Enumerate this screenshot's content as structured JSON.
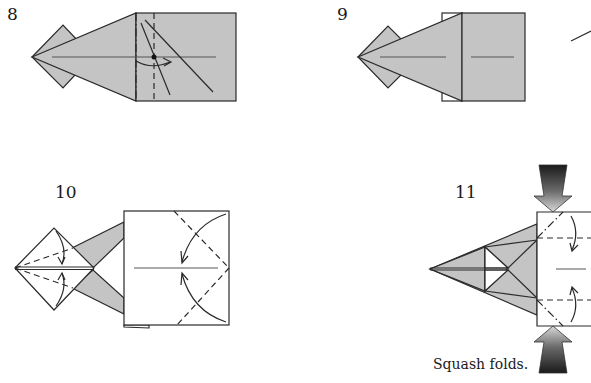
{
  "steps": [
    {
      "number": "8",
      "description": "Diagram step 8: mountain and valley fold with rotating arrow"
    },
    {
      "number": "9",
      "description": "Diagram step 9: result after folding"
    },
    {
      "number": "10",
      "description": "Diagram step 10: valley folds with arrows toward center"
    },
    {
      "number": "11",
      "description": "Diagram step 11: squash folds with push arrows"
    }
  ],
  "caption": "Squash folds.",
  "colors": {
    "paper_gray": "#c4c4c4",
    "line": "#2a2a2a",
    "background": "#ffffff"
  }
}
